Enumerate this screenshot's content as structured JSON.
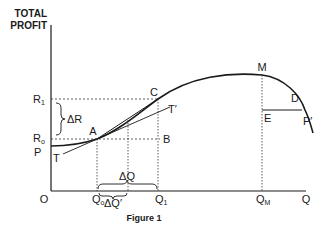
{
  "figure": {
    "caption": "Figure 1",
    "y_axis_title_line1": "TOTAL",
    "y_axis_title_line2": "PROFIT",
    "origin_label": "O",
    "x_axis_end_label": "Q"
  },
  "y_labels": {
    "r1": "R",
    "r1_sub": "1",
    "r0": "R",
    "r0_sub": "o",
    "p": "P",
    "delta_r": "ΔR"
  },
  "x_labels": {
    "q0": "Q",
    "q0_sub": "o",
    "q1": "Q",
    "q1_sub": "1",
    "qm": "Q",
    "qm_sub": "M",
    "delta_q": "ΔQ",
    "delta_q_prime": "ΔQ′"
  },
  "points": {
    "a": "A",
    "b": "B",
    "c": "C",
    "d": "D",
    "e": "E",
    "m": "M",
    "t": "T",
    "t_prime": "T′",
    "p_prime": "P′"
  },
  "colors": {
    "ink": "#1a1a1a",
    "background": "#ffffff"
  }
}
